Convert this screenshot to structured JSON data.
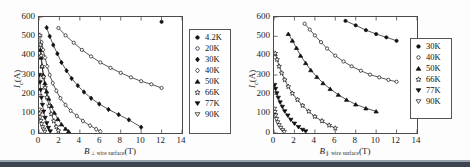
{
  "figure": {
    "background_color": "#fdfdfd",
    "axis_color": "#4a4a4a",
    "marker_color": "#111111"
  },
  "chart_data": [
    {
      "type": "scatter",
      "title": "",
      "panel": "left",
      "xlabel_parts": {
        "symbol": "B",
        "subscript": "⊥ wire surface",
        "unit": "(T)"
      },
      "ylabel_parts": {
        "symbol": "I",
        "subscript": "c",
        "unit": "(A)"
      },
      "xlabel": "B ⊥ wire surface (T)",
      "ylabel": "Ic (A)",
      "xlim": [
        0,
        14
      ],
      "ylim": [
        0,
        600
      ],
      "xticks": [
        0,
        2,
        4,
        6,
        8,
        10,
        12,
        14
      ],
      "yticks": [
        0,
        100,
        200,
        300,
        400,
        500,
        600
      ],
      "xtick_labels": [
        "0",
        "2",
        "4",
        "6",
        "8",
        "10",
        "12",
        "14"
      ],
      "ytick_labels": [
        "0",
        "100",
        "200",
        "300",
        "400",
        "500",
        "600"
      ],
      "grid": false,
      "legend_position": "outside-right",
      "series": [
        {
          "name": "4.2K",
          "marker": "filled-circle",
          "x": [
            12.0
          ],
          "y": [
            575
          ]
        },
        {
          "name": "20K",
          "marker": "open-circle",
          "x": [
            1.9,
            2.6,
            3.4,
            4.2,
            5.1,
            6.0,
            7.0,
            8.0,
            9.0,
            10.0,
            11.0,
            12.0
          ],
          "y": [
            543,
            505,
            467,
            430,
            396,
            365,
            337,
            311,
            288,
            268,
            252,
            233
          ]
        },
        {
          "name": "30K",
          "marker": "filled-diamond",
          "x": [
            0.75,
            1.05,
            1.4,
            1.8,
            2.2,
            2.7,
            3.2,
            3.8,
            4.4,
            5.1,
            5.9,
            6.8,
            7.8,
            8.8,
            10.0
          ],
          "y": [
            545,
            500,
            455,
            410,
            365,
            322,
            282,
            245,
            212,
            180,
            150,
            122,
            95,
            68,
            30
          ]
        },
        {
          "name": "40K",
          "marker": "open-diamond",
          "x": [
            0.25,
            0.4,
            0.6,
            0.8,
            1.05,
            1.35,
            1.7,
            2.1,
            2.6,
            3.1,
            3.7,
            4.3,
            5.0,
            5.6,
            6.0
          ],
          "y": [
            470,
            430,
            390,
            345,
            300,
            258,
            218,
            180,
            145,
            115,
            88,
            62,
            38,
            20,
            8
          ]
        },
        {
          "name": "50K",
          "marker": "filled-triangle",
          "x": [
            0.12,
            0.2,
            0.3,
            0.42,
            0.58,
            0.75,
            0.95,
            1.2,
            1.5,
            1.85,
            2.2,
            2.6,
            2.9
          ],
          "y": [
            430,
            390,
            345,
            300,
            258,
            215,
            178,
            140,
            105,
            72,
            45,
            22,
            8
          ]
        },
        {
          "name": "66K",
          "marker": "open-star",
          "x": [
            0.08,
            0.14,
            0.22,
            0.32,
            0.45,
            0.6,
            0.78,
            0.98,
            1.2,
            1.45,
            1.7,
            1.9
          ],
          "y": [
            505,
            455,
            400,
            345,
            290,
            235,
            185,
            140,
            98,
            62,
            32,
            12
          ]
        },
        {
          "name": "77K",
          "marker": "filled-down-triangle",
          "x": [
            0.05,
            0.1,
            0.16,
            0.24,
            0.34,
            0.46,
            0.6,
            0.76,
            0.92,
            1.1
          ],
          "y": [
            300,
            262,
            222,
            182,
            145,
            110,
            78,
            50,
            26,
            8
          ]
        },
        {
          "name": "90K",
          "marker": "open-down-triangle",
          "x": [
            0.03,
            0.07,
            0.12,
            0.18,
            0.26,
            0.35,
            0.45,
            0.56
          ],
          "y": [
            120,
            100,
            80,
            62,
            45,
            30,
            17,
            6
          ]
        }
      ],
      "legend": [
        {
          "label": "4.2K",
          "marker": "filled-circle"
        },
        {
          "label": "20K",
          "marker": "open-circle"
        },
        {
          "label": "30K",
          "marker": "filled-diamond"
        },
        {
          "label": "40K",
          "marker": "open-diamond"
        },
        {
          "label": "50K",
          "marker": "filled-triangle"
        },
        {
          "label": "66K",
          "marker": "open-star"
        },
        {
          "label": "77K",
          "marker": "filled-down-triangle"
        },
        {
          "label": "90K",
          "marker": "open-down-triangle"
        }
      ]
    },
    {
      "type": "scatter",
      "title": "",
      "panel": "right",
      "xlabel_parts": {
        "symbol": "B",
        "subscript": "∥ wire surface",
        "unit": "(T)"
      },
      "ylabel_parts": {
        "symbol": "I",
        "subscript": "c",
        "unit": "(A)"
      },
      "xlabel": "B ∥ wire surface (T)",
      "ylabel": "Ic (A)",
      "xlim": [
        0,
        14
      ],
      "ylim": [
        0,
        600
      ],
      "xticks": [
        0,
        2,
        4,
        6,
        8,
        10,
        12,
        14
      ],
      "yticks": [
        0,
        100,
        200,
        300,
        400,
        500,
        600
      ],
      "xtick_labels": [
        "0",
        "2",
        "4",
        "6",
        "8",
        "10",
        "12",
        "14"
      ],
      "ytick_labels": [
        "0",
        "100",
        "200",
        "300",
        "400",
        "500",
        "600"
      ],
      "grid": false,
      "legend_position": "outside-right",
      "series": [
        {
          "name": "30K",
          "marker": "filled-circle",
          "x": [
            7.0,
            8.0,
            9.0,
            10.0,
            11.0,
            12.0
          ],
          "y": [
            580,
            557,
            532,
            512,
            495,
            477
          ]
        },
        {
          "name": "40K",
          "marker": "open-circle",
          "x": [
            3.0,
            3.5,
            4.0,
            4.6,
            5.2,
            6.0,
            6.8,
            7.6,
            8.5,
            9.4,
            10.3,
            11.2,
            12.0
          ],
          "y": [
            565,
            535,
            505,
            470,
            437,
            400,
            370,
            345,
            322,
            302,
            288,
            275,
            265
          ]
        },
        {
          "name": "50K",
          "marker": "filled-triangle",
          "x": [
            1.4,
            1.8,
            2.2,
            2.6,
            3.1,
            3.6,
            4.2,
            4.8,
            5.5,
            6.3,
            7.1,
            8.0,
            9.0,
            10.0
          ],
          "y": [
            513,
            478,
            440,
            400,
            362,
            325,
            290,
            258,
            228,
            198,
            172,
            148,
            128,
            112
          ]
        },
        {
          "name": "66K",
          "marker": "open-star",
          "x": [
            0.12,
            0.3,
            0.5,
            0.75,
            1.05,
            1.4,
            1.8,
            2.3,
            2.8,
            3.4,
            4.0,
            4.7,
            5.4,
            6.0
          ],
          "y": [
            412,
            380,
            345,
            310,
            275,
            240,
            205,
            172,
            142,
            112,
            85,
            62,
            40,
            25
          ]
        },
        {
          "name": "77K",
          "marker": "filled-down-triangle",
          "x": [
            0.06,
            0.15,
            0.27,
            0.42,
            0.6,
            0.82,
            1.05,
            1.35,
            1.65,
            2.0,
            2.4,
            2.8,
            3.1
          ],
          "y": [
            248,
            228,
            205,
            182,
            158,
            135,
            112,
            90,
            68,
            48,
            30,
            16,
            8
          ]
        },
        {
          "name": "90K",
          "marker": "open-down-triangle",
          "x": [
            0.04,
            0.09,
            0.16,
            0.25,
            0.36,
            0.5,
            0.66,
            0.85,
            1.0
          ],
          "y": [
            125,
            108,
            90,
            72,
            55,
            40,
            26,
            14,
            5
          ]
        }
      ],
      "legend": [
        {
          "label": "30K",
          "marker": "filled-circle"
        },
        {
          "label": "40K",
          "marker": "open-circle"
        },
        {
          "label": "50K",
          "marker": "filled-triangle"
        },
        {
          "label": "66K",
          "marker": "open-star"
        },
        {
          "label": "77K",
          "marker": "filled-down-triangle"
        },
        {
          "label": "90K",
          "marker": "open-down-triangle"
        }
      ]
    }
  ]
}
